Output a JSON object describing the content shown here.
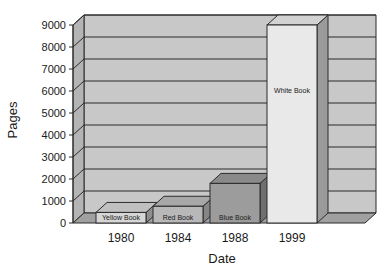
{
  "chart_data": {
    "type": "bar",
    "title": "",
    "subtitle": "",
    "xlabel": "Date",
    "ylabel": "Pages",
    "categories": [
      "1980",
      "1984",
      "1988",
      "1999"
    ],
    "values": [
      480,
      760,
      1800,
      9000
    ],
    "point_labels": [
      "Yellow Book",
      "Red Book",
      "Blue Book",
      "White Book"
    ],
    "ylim": [
      0,
      9000
    ],
    "ytick_labels": [
      "0",
      "1000",
      "2000",
      "3000",
      "4000",
      "5000",
      "6000",
      "7000",
      "8000",
      "9000"
    ],
    "ytick_values": [
      0,
      1000,
      2000,
      3000,
      4000,
      5000,
      6000,
      7000,
      8000,
      9000
    ],
    "grid": true,
    "legend": "none",
    "projection": "3d",
    "series": [
      {
        "name": "Pages",
        "values": [
          480,
          760,
          1800,
          9000
        ]
      }
    ]
  },
  "colors": {
    "back_wall": "#c8c8c8",
    "side_wall": "#b4b4b4",
    "floor": "#a0a0a0",
    "gridline": "#2b2b2b",
    "outline": "#2b2b2b",
    "bar_yellow_front": "#d6d6d6",
    "bar_yellow_top": "#c0c0c0",
    "bar_yellow_side": "#8f8f8f",
    "bar_red_front": "#b8b8b8",
    "bar_red_top": "#a8a8a8",
    "bar_red_side": "#868686",
    "bar_blue_front": "#9c9c9c",
    "bar_blue_top": "#8a8a8a",
    "bar_blue_side": "#6f6f6f",
    "bar_white_front": "#e9e9e9",
    "bar_white_top": "#d2d2d2",
    "bar_white_side": "#9a9a9a",
    "text": "#1a1a1a",
    "background": "#ffffff"
  },
  "axis": {
    "y_title": "Pages",
    "x_title": "Date"
  }
}
